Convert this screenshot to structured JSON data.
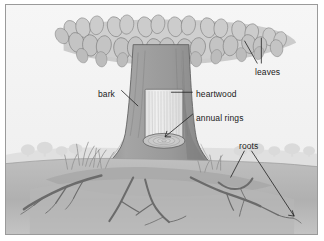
{
  "figure": {
    "style": "grayscale line-art botanical diagram with cutaway trunk",
    "border_color": "#9a9a9a",
    "background_color": "#f4f4f4"
  },
  "labels": [
    {
      "id": "leaves",
      "text": "leaves",
      "target": "canopy foliage"
    },
    {
      "id": "bark",
      "text": "bark",
      "target": "outer trunk surface"
    },
    {
      "id": "heartwood",
      "text": "heartwood",
      "target": "cutaway inner wood"
    },
    {
      "id": "annual-rings",
      "text": "annual rings",
      "target": "stump cross-section"
    },
    {
      "id": "roots",
      "text": "roots",
      "target": "underground root system"
    }
  ],
  "parts": {
    "canopy": "flat broad crown of overlapping teardrop leaves",
    "trunk": "thick tapering trunk flaring into buttress roots",
    "cutaway_window": "rectangular cut revealing vertical wood grain",
    "stump_section": "elliptical cross-section showing concentric rings",
    "ground": "soil bank with grass tufts and distant treeline"
  },
  "colors": {
    "sky": "#f4f4f4",
    "leaf_fill": "#c9c9c9",
    "leaf_shadow": "#a9a9a9",
    "bark": "#9c9c9c",
    "bark_dark": "#7d7d7d",
    "heartwood": "#ececec",
    "soil": "#b8b8b8",
    "soil_dark": "#9d9d9d",
    "root": "#6e6e6e",
    "outline": "#4d4d4d",
    "text": "#1a1a1a",
    "distant": "#dcdcdc"
  }
}
